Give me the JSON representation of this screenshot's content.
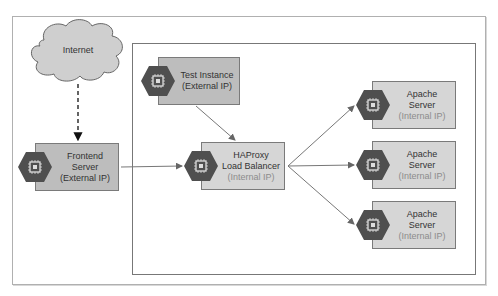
{
  "diagram": {
    "title_clipped": "",
    "colors": {
      "external_fill": "#bdbdbd",
      "internal_fill": "#d6d6d6",
      "hex_fill": "#4f4f4f",
      "cloud_fill": "#cfcfcf",
      "line": "#777777"
    },
    "cloud": {
      "label": "Internet"
    },
    "nodes": [
      {
        "id": "frontend",
        "line1": "Frontend",
        "line2": "Server",
        "line3": "(External IP)",
        "icon": "compute-chip-icon"
      },
      {
        "id": "test",
        "line1": "Test Instance",
        "line2": "(External IP)",
        "icon": "compute-chip-icon"
      },
      {
        "id": "haproxy",
        "line1": "HAProxy",
        "line2": "Load Balancer",
        "line3": "(Internal IP)",
        "icon": "compute-chip-icon"
      },
      {
        "id": "apache1",
        "line1": "Apache",
        "line2": "Server",
        "line3": "(Internal IP)",
        "icon": "compute-chip-icon"
      },
      {
        "id": "apache2",
        "line1": "Apache",
        "line2": "Server",
        "line3": "(Internal IP)",
        "icon": "compute-chip-icon"
      },
      {
        "id": "apache3",
        "line1": "Apache",
        "line2": "Server",
        "line3": "(Internal IP)",
        "icon": "compute-chip-icon"
      }
    ],
    "edges": [
      {
        "from": "Internet",
        "to": "Frontend Server",
        "style": "dashed"
      },
      {
        "from": "Frontend Server",
        "to": "HAProxy Load Balancer",
        "style": "solid"
      },
      {
        "from": "Test Instance",
        "to": "HAProxy Load Balancer",
        "style": "solid"
      },
      {
        "from": "HAProxy Load Balancer",
        "to": "Apache Server 1",
        "style": "solid"
      },
      {
        "from": "HAProxy Load Balancer",
        "to": "Apache Server 2",
        "style": "solid"
      },
      {
        "from": "HAProxy Load Balancer",
        "to": "Apache Server 3",
        "style": "solid"
      }
    ]
  }
}
